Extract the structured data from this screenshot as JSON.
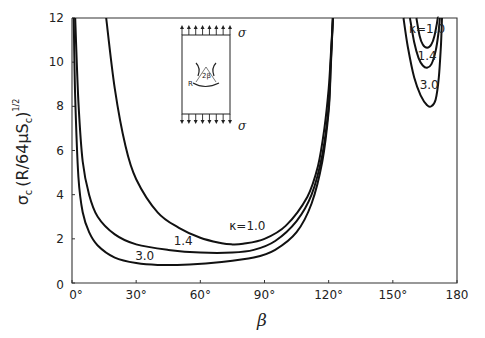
{
  "chart_data": {
    "type": "line",
    "title": "",
    "xlabel": "β",
    "ylabel": "σc (R/64μSc)^1/2",
    "ylabel_parts": {
      "main": "σ",
      "sub": "c",
      "paren": "(R/64μS",
      "sub2": "c",
      "close": ")",
      "sup": "1/2"
    },
    "xlim": [
      0,
      180
    ],
    "ylim": [
      0,
      12
    ],
    "grid": false,
    "x_ticks": [
      0,
      30,
      60,
      90,
      120,
      150,
      180
    ],
    "x_tick_labels": [
      "0°",
      "30°",
      "60°",
      "90°",
      "120°",
      "150°",
      "180"
    ],
    "y_ticks": [
      0,
      2,
      4,
      6,
      8,
      10,
      12
    ],
    "y_tick_labels": [
      "0",
      "2",
      "4",
      "6",
      "8",
      "10",
      "12"
    ],
    "series": [
      {
        "name": "κ=1.0",
        "branch": "left",
        "x": [
          16,
          20,
          25,
          30,
          40,
          50,
          60,
          70,
          75,
          80,
          90,
          100,
          110,
          115,
          118,
          120,
          121,
          122
        ],
        "y": [
          12,
          8.8,
          6.2,
          4.7,
          3.2,
          2.5,
          2.05,
          1.8,
          1.75,
          1.78,
          2.0,
          2.6,
          3.9,
          5.3,
          7.0,
          8.8,
          10.3,
          12
        ]
      },
      {
        "name": "κ=1.4",
        "branch": "left",
        "x": [
          1.5,
          3,
          5,
          8,
          12,
          20,
          30,
          45,
          60,
          75,
          85,
          95,
          105,
          112,
          117,
          120,
          121,
          122
        ],
        "y": [
          12,
          8.2,
          5.5,
          4.0,
          3.0,
          2.2,
          1.75,
          1.5,
          1.38,
          1.38,
          1.5,
          1.9,
          2.8,
          4.0,
          5.8,
          8.0,
          10,
          12
        ]
      },
      {
        "name": "κ=3.0",
        "branch": "left",
        "x": [
          0.8,
          1.5,
          3,
          5,
          8,
          12,
          20,
          30,
          40,
          55,
          70,
          85,
          95,
          105,
          112,
          117,
          120,
          121,
          122
        ],
        "y": [
          12,
          8.4,
          4.8,
          3.2,
          2.3,
          1.7,
          1.15,
          0.9,
          0.82,
          0.84,
          0.95,
          1.15,
          1.5,
          2.3,
          3.6,
          5.5,
          7.8,
          9.8,
          12
        ]
      },
      {
        "name": "κ=1.0",
        "branch": "right",
        "x": [
          161,
          162.5,
          164,
          166,
          168,
          169.5,
          170.5,
          171,
          171.3
        ],
        "y": [
          12,
          11.2,
          10.8,
          10.65,
          10.8,
          11.2,
          11.7,
          12,
          12
        ]
      },
      {
        "name": "κ=1.4",
        "branch": "right",
        "x": [
          158,
          160,
          162,
          164,
          166,
          168,
          170,
          171.3,
          172
        ],
        "y": [
          12,
          10.9,
          10.2,
          9.85,
          9.75,
          9.9,
          10.5,
          11.3,
          12
        ]
      },
      {
        "name": "κ=3.0",
        "branch": "right",
        "x": [
          155,
          157,
          160,
          163,
          166,
          168,
          170,
          171.5,
          172.5,
          173
        ],
        "y": [
          12,
          10.7,
          9.3,
          8.5,
          8.05,
          8.0,
          8.3,
          9.3,
          10.8,
          12
        ]
      }
    ],
    "annotations": [
      {
        "text": "κ=1.0",
        "x": 82,
        "y": 2.4,
        "target": "left κ=1.0"
      },
      {
        "text": "1.4",
        "x": 52,
        "y": 1.7,
        "target": "left κ=1.4"
      },
      {
        "text": "3.0",
        "x": 34,
        "y": 1.05,
        "target": "left κ=3.0"
      },
      {
        "text": "κ=1.0",
        "x": 166,
        "y": 11.3,
        "target": "right κ=1.0"
      },
      {
        "text": "1.4",
        "x": 166,
        "y": 10.1,
        "target": "right κ=1.4"
      },
      {
        "text": "3.0",
        "x": 167,
        "y": 8.8,
        "target": "right κ=3.0"
      }
    ],
    "inset": {
      "description": "Plate under uniaxial tension σ with circular arc crack of radius R subtending angle 2β",
      "labels": {
        "sigma_top": "σ",
        "sigma_bottom": "σ",
        "radius": "R",
        "angle": "2β"
      }
    }
  }
}
